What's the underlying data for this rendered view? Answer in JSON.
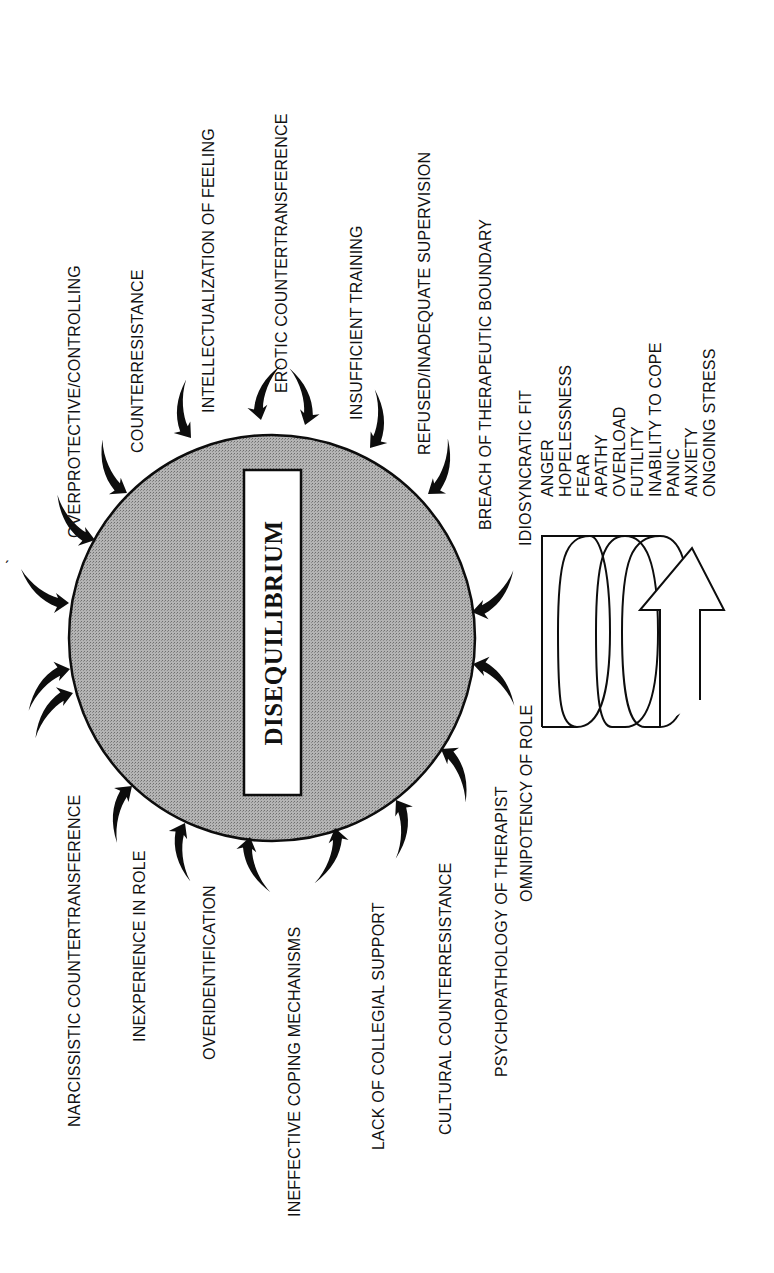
{
  "diagram": {
    "center_label": "DISEQUILIBRIUM",
    "colors": {
      "circle_fill": "#a9a9a9",
      "ink": "#111111",
      "background": "#ffffff"
    },
    "inward_arrows_count": 18,
    "pressures_left": [
      "NARCISSISTIC COUNTERTRANSFERENCE",
      "INEXPERIENCE IN ROLE",
      "OVERIDENTIFICATION",
      "INEFFECTIVE COPING MECHANISMS",
      "LACK OF COLLEGIAL SUPPORT",
      "CULTURAL COUNTERRESISTANCE",
      "PSYCHOPATHOLOGY OF THERAPIST",
      "OMNIPOTENCY OF ROLE"
    ],
    "pressures_right": [
      "OVERPROTECTIVE/CONTROLLING",
      "COUNTERRESISTANCE",
      "INTELLECTUALIZATION OF FEELING",
      "EROTIC COUNTERTRANSFERENCE",
      "INSUFFICIENT TRAINING",
      "REFUSED/INADEQUATE SUPERVISION",
      "BREACH OF THERAPEUTIC BOUNDARY",
      "IDIOSYNCRATIC FIT"
    ],
    "spiral_outcomes": [
      "ANGER",
      "HOPELESSNESS",
      "FEAR",
      "APATHY",
      "OVERLOAD",
      "FUTILITY",
      "INABILITY TO COPE",
      "PANIC",
      "ANXIETY",
      "ONGOING STRESS"
    ],
    "stray_mark": "ˏ"
  }
}
